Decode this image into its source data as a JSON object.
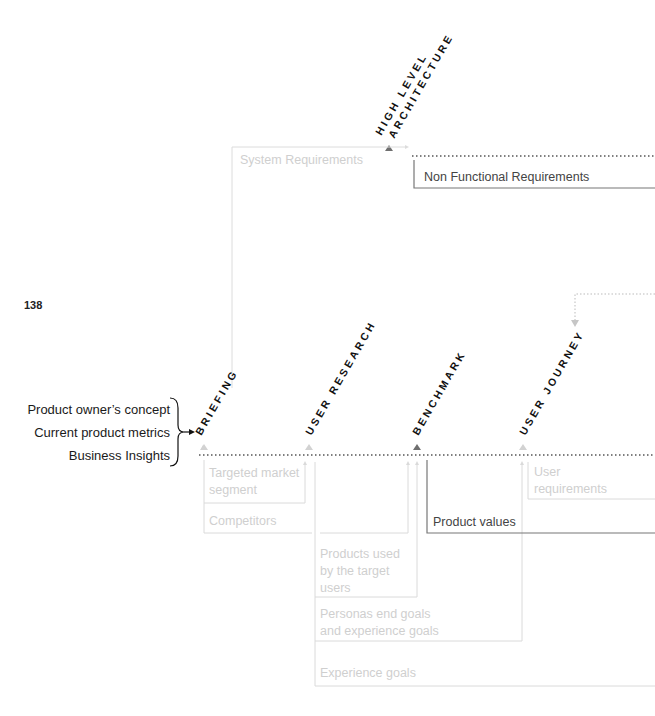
{
  "page_number": "138",
  "inputs": [
    "Product owner’s concept",
    "Current product metrics",
    "Business Insights"
  ],
  "stages": {
    "briefing": "BRIEFING",
    "user_research": "USER RESEARCH",
    "benchmark": "BENCHMARK",
    "user_journey": "USER JOURNEY",
    "high_level_architecture_line1": "HIGH LEVEL",
    "high_level_architecture_line2": "ARCHITECTURE"
  },
  "outputs": {
    "system_requirements": "System Requirements",
    "non_functional_requirements": "Non Functional Requirements",
    "targeted_market_segment_1": "Targeted market",
    "targeted_market_segment_2": "segment",
    "competitors": "Competitors",
    "products_used_1": "Products used",
    "products_used_2": "by the target",
    "products_used_3": "users",
    "personas_1": "Personas end goals",
    "personas_2": "and experience goals",
    "experience_goals": "Experience goals",
    "product_values": "Product values",
    "user_requirements_1": "User",
    "user_requirements_2": "requirements"
  },
  "colors": {
    "dark_line": "#6b6b6b",
    "light_line": "#d6d6d6",
    "dark_triangle": "#6f6f6f",
    "light_triangle": "#d2d2d2"
  }
}
